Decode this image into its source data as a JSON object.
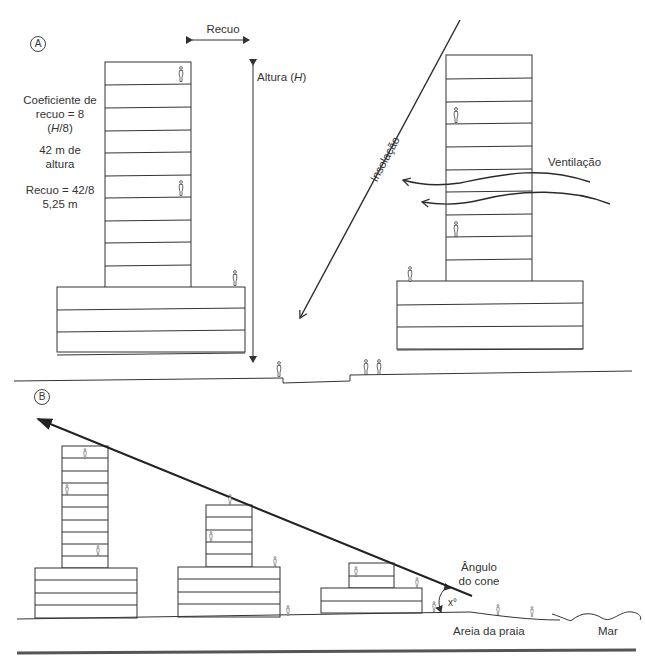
{
  "section_a": {
    "marker": "A",
    "recuo_label": "Recuo",
    "altura_label_prefix": "Altura (",
    "altura_label_var": "H",
    "altura_label_suffix": ")",
    "coef_line1": "Coeficiente de",
    "coef_line2": "recuo = 8",
    "coef_line3_var": "H",
    "coef_line3_rest": "/8)",
    "coef_line3_open": "(",
    "height_line1": "42 m de",
    "height_line2": "altura",
    "recuo_calc_line1": "Recuo = 42/8",
    "recuo_calc_line2": "5,25 m",
    "insolacao_label": "Insolação",
    "ventilacao_label": "Ventilação",
    "buildings": [
      {
        "name": "left",
        "tower_floors": 10,
        "podium_floors": 4
      },
      {
        "name": "right",
        "tower_floors": 10,
        "podium_floors": 4
      }
    ]
  },
  "section_b": {
    "marker": "B",
    "angle_label_line1": "Ângulo",
    "angle_label_line2": "do cone",
    "angle_value": "x°",
    "beach_label": "Areia da praia",
    "sea_label": "Mar",
    "buildings": [
      {
        "name": "b1",
        "tower_floors": 10,
        "podium_floors": 4
      },
      {
        "name": "b2",
        "tower_floors": 5,
        "podium_floors": 4
      },
      {
        "name": "b3",
        "tower_floors": 2,
        "podium_floors": 2
      }
    ]
  },
  "colors": {
    "line": "#333333",
    "bold_line": "#2b2b2b",
    "bottom_rule": "#555555"
  }
}
